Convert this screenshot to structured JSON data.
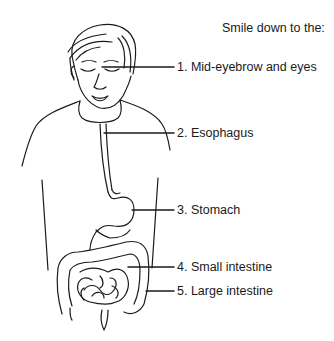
{
  "title": "Smile down to the:",
  "labels": [
    {
      "num": "1.",
      "text": "Mid-eyebrow and eyes"
    },
    {
      "num": "2.",
      "text": "Esophagus"
    },
    {
      "num": "3.",
      "text": "Stomach"
    },
    {
      "num": "4.",
      "text": "Small intestine"
    },
    {
      "num": "5.",
      "text": "Large intestine"
    }
  ],
  "label_strings": [
    "1. Mid-eyebrow and eyes",
    "2. Esophagus",
    "3. Stomach",
    "4. Small intestine",
    "5. Large intestine"
  ],
  "figure": {
    "organs": [
      "esophagus",
      "stomach",
      "small-intestine",
      "large-intestine"
    ],
    "line_color": "#1a1a1a"
  }
}
